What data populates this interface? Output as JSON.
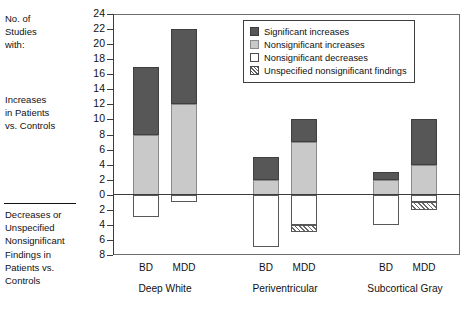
{
  "axis_side_labels": {
    "top": "No. of\nStudies\nwith:",
    "middle": "Increases\nin Patients\nvs. Controls",
    "bottom": "Decreases or\nUnspecified\nNonsignificant\nFindings in\nPatients vs.\nControls"
  },
  "legend": {
    "items": [
      {
        "label": "Significant increases",
        "swatch": "dark-gray-filled-swatch",
        "color": "#575757"
      },
      {
        "label": "Nonsignificant increases",
        "swatch": "light-gray-filled-swatch",
        "color": "#c9c9c9"
      },
      {
        "label": "Nonsignificant decreases",
        "swatch": "white-swatch",
        "color": "#ffffff"
      },
      {
        "label": "Unspecified nonsignificant findings",
        "swatch": "hatched-swatch",
        "color": "#ffffff"
      }
    ]
  },
  "y_ticks": [
    {
      "label": "24",
      "value": 24
    },
    {
      "label": "22",
      "value": 22
    },
    {
      "label": "20",
      "value": 20
    },
    {
      "label": "18",
      "value": 18
    },
    {
      "label": "16",
      "value": 16
    },
    {
      "label": "14",
      "value": 14
    },
    {
      "label": "12",
      "value": 12
    },
    {
      "label": "10",
      "value": 10
    },
    {
      "label": "8",
      "value": 8
    },
    {
      "label": "6",
      "value": 6
    },
    {
      "label": "4",
      "value": 4
    },
    {
      "label": "2",
      "value": 2
    },
    {
      "label": "0",
      "value": 0
    },
    {
      "label": "2",
      "value": -2
    },
    {
      "label": "4",
      "value": -4
    },
    {
      "label": "6",
      "value": -6
    },
    {
      "label": "8",
      "value": -8
    }
  ],
  "x_ticks": [
    "BD",
    "MDD",
    "BD",
    "MDD",
    "BD",
    "MDD"
  ],
  "x_groups": [
    "Deep White",
    "Periventricular",
    "Subcortical Gray"
  ],
  "chart_data": {
    "type": "bar",
    "title": "",
    "xlabel": "",
    "ylabel": "No. of Studies with:",
    "ylim": [
      -8,
      24
    ],
    "grid": false,
    "stacked": true,
    "legend_position": "top-right",
    "categories": [
      "Deep White BD",
      "Deep White MDD",
      "Periventricular BD",
      "Periventricular MDD",
      "Subcortical Gray BD",
      "Subcortical Gray MDD"
    ],
    "groups": [
      {
        "region": "Deep White",
        "bars": [
          {
            "name": "BD",
            "segments": [
              {
                "series": "Nonsignificant increases",
                "from": 0,
                "to": 8
              },
              {
                "series": "Significant increases",
                "from": 8,
                "to": 17
              },
              {
                "series": "Nonsignificant decreases",
                "from": 0,
                "to": -3
              }
            ]
          },
          {
            "name": "MDD",
            "segments": [
              {
                "series": "Nonsignificant increases",
                "from": 0,
                "to": 12
              },
              {
                "series": "Significant increases",
                "from": 12,
                "to": 22
              },
              {
                "series": "Nonsignificant decreases",
                "from": 0,
                "to": -1
              }
            ]
          }
        ]
      },
      {
        "region": "Periventricular",
        "bars": [
          {
            "name": "BD",
            "segments": [
              {
                "series": "Nonsignificant increases",
                "from": 0,
                "to": 2
              },
              {
                "series": "Significant increases",
                "from": 2,
                "to": 5
              },
              {
                "series": "Nonsignificant decreases",
                "from": 0,
                "to": -7
              }
            ]
          },
          {
            "name": "MDD",
            "segments": [
              {
                "series": "Nonsignificant increases",
                "from": 0,
                "to": 7
              },
              {
                "series": "Significant increases",
                "from": 7,
                "to": 10
              },
              {
                "series": "Nonsignificant decreases",
                "from": 0,
                "to": -4
              },
              {
                "series": "Unspecified nonsignificant findings",
                "from": -4,
                "to": -5
              }
            ]
          }
        ]
      },
      {
        "region": "Subcortical Gray",
        "bars": [
          {
            "name": "BD",
            "segments": [
              {
                "series": "Nonsignificant increases",
                "from": 0,
                "to": 2
              },
              {
                "series": "Significant increases",
                "from": 2,
                "to": 3
              },
              {
                "series": "Nonsignificant decreases",
                "from": 0,
                "to": -4
              }
            ]
          },
          {
            "name": "MDD",
            "segments": [
              {
                "series": "Nonsignificant increases",
                "from": 0,
                "to": 4
              },
              {
                "series": "Significant increases",
                "from": 4,
                "to": 10
              },
              {
                "series": "Nonsignificant decreases",
                "from": 0,
                "to": -1
              },
              {
                "series": "Unspecified nonsignificant findings",
                "from": -1,
                "to": -2
              }
            ]
          }
        ]
      }
    ],
    "series_colors": {
      "Significant increases": "#575757",
      "Nonsignificant increases": "#c9c9c9",
      "Nonsignificant decreases": "#ffffff",
      "Unspecified nonsignificant findings": "#ffffff"
    }
  }
}
